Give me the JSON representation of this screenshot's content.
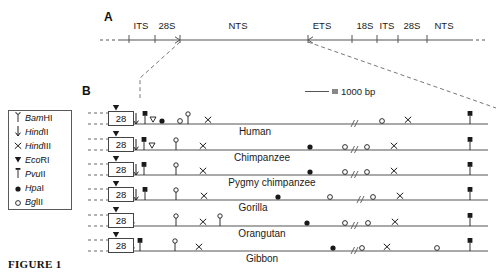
{
  "figure": {
    "caption": "FIGURE 1",
    "panel_a_letter": "A",
    "panel_b_letter": "B"
  },
  "scale": {
    "line_symbol": "line-segment",
    "equals_symbol": "=",
    "label": "1000 bp"
  },
  "panel_a": {
    "segments": [
      {
        "label": "ITS",
        "x": 141
      },
      {
        "label": "28S",
        "x": 167
      },
      {
        "label": "NTS",
        "x": 238
      },
      {
        "label": "ETS",
        "x": 322
      },
      {
        "label": "18S",
        "x": 365
      },
      {
        "label": "ITS",
        "x": 387
      },
      {
        "label": "28S",
        "x": 412
      },
      {
        "label": "NTS",
        "x": 444
      }
    ],
    "axis_y": 40,
    "axis_start_x": 118,
    "axis_end_x": 470,
    "ticks": [
      129,
      155,
      180,
      308,
      352,
      377,
      398,
      427
    ],
    "arrow_ticks": [
      180,
      308
    ]
  },
  "legend": {
    "title": "Restriction enzymes",
    "items": [
      {
        "symbol": "bamhi-lollipop-open",
        "italic": "Bam",
        "rest": "HI"
      },
      {
        "symbol": "hindii-arrow-down",
        "italic": "Hind",
        "rest": "II"
      },
      {
        "symbol": "hindiii-cross",
        "italic": "Hind",
        "rest": "III"
      },
      {
        "symbol": "ecori-triangle-filled",
        "italic": "Eco",
        "rest": "RI"
      },
      {
        "symbol": "pvuii-lollipop-filled-square",
        "italic": "Pvu",
        "rest": "II"
      },
      {
        "symbol": "hpai-dot-filled",
        "italic": "Hpa",
        "rest": "I"
      },
      {
        "symbol": "bgiii-dot-open",
        "italic": "Bg",
        "rest": "lII"
      }
    ]
  },
  "panel_b": {
    "box_label": "28",
    "rows": [
      {
        "species": "Human",
        "y": 124,
        "label_x": 255,
        "line_start": 133,
        "line_end": 488,
        "break_x": 352,
        "markers": [
          {
            "type": "ecori-triangle-filled",
            "x": 116,
            "above": true
          },
          {
            "type": "hindii-arrow-down",
            "x": 136
          },
          {
            "type": "pvuii-lollipop-filled-square",
            "x": 145
          },
          {
            "type": "ecori-triangle-open",
            "x": 153
          },
          {
            "type": "hpai-dot-filled",
            "x": 162
          },
          {
            "type": "bgiii-dot-open",
            "x": 180
          },
          {
            "type": "bamhi-lollipop-open",
            "x": 188
          },
          {
            "type": "hindiii-cross",
            "x": 208
          },
          {
            "type": "bgiii-dot-open",
            "x": 382
          },
          {
            "type": "hindiii-cross",
            "x": 408
          },
          {
            "type": "pvuii-lollipop-filled-square",
            "x": 470
          }
        ]
      },
      {
        "species": "Chimpanzee",
        "y": 150,
        "label_x": 262,
        "line_start": 133,
        "line_end": 488,
        "break_x": 352,
        "markers": [
          {
            "type": "ecori-triangle-filled",
            "x": 116,
            "above": true
          },
          {
            "type": "hindii-arrow-down",
            "x": 136
          },
          {
            "type": "pvuii-lollipop-filled-square",
            "x": 144
          },
          {
            "type": "ecori-triangle-open",
            "x": 152
          },
          {
            "type": "bamhi-lollipop-open",
            "x": 176
          },
          {
            "type": "hindiii-cross",
            "x": 203
          },
          {
            "type": "hpai-dot-filled",
            "x": 310
          },
          {
            "type": "bgiii-dot-open",
            "x": 345
          },
          {
            "type": "bgiii-dot-open",
            "x": 367
          },
          {
            "type": "hindiii-cross",
            "x": 394
          },
          {
            "type": "pvuii-lollipop-filled-square",
            "x": 470
          }
        ]
      },
      {
        "species": "Pygmy chimpanzee",
        "y": 175,
        "label_x": 272,
        "line_start": 133,
        "line_end": 488,
        "break_x": 352,
        "markers": [
          {
            "type": "ecori-triangle-filled",
            "x": 116,
            "above": true
          },
          {
            "type": "hindii-arrow-down",
            "x": 136
          },
          {
            "type": "pvuii-lollipop-filled-square",
            "x": 144
          },
          {
            "type": "bamhi-lollipop-open",
            "x": 176
          },
          {
            "type": "hindiii-cross",
            "x": 203
          },
          {
            "type": "hpai-dot-filled",
            "x": 310
          },
          {
            "type": "bgiii-dot-open",
            "x": 345
          },
          {
            "type": "bgiii-dot-open",
            "x": 367
          },
          {
            "type": "hindiii-cross",
            "x": 394
          },
          {
            "type": "pvuii-lollipop-filled-square",
            "x": 470
          }
        ]
      },
      {
        "species": "Gorilla",
        "y": 200,
        "label_x": 253,
        "line_start": 133,
        "line_end": 488,
        "break_x": 358,
        "markers": [
          {
            "type": "ecori-triangle-filled",
            "x": 116,
            "above": true
          },
          {
            "type": "hindii-arrow-down",
            "x": 136
          },
          {
            "type": "pvuii-lollipop-filled-square",
            "x": 145
          },
          {
            "type": "bamhi-lollipop-open",
            "x": 176
          },
          {
            "type": "hindiii-cross",
            "x": 204
          },
          {
            "type": "hpai-dot-filled",
            "x": 278
          },
          {
            "type": "bgiii-dot-open",
            "x": 330
          },
          {
            "type": "bgiii-dot-open",
            "x": 373
          },
          {
            "type": "hindiii-cross",
            "x": 400
          },
          {
            "type": "pvuii-lollipop-filled-square",
            "x": 470
          }
        ]
      },
      {
        "species": "Orangutan",
        "y": 226,
        "label_x": 262,
        "line_start": 133,
        "line_end": 488,
        "break_x": 352,
        "markers": [
          {
            "type": "ecori-triangle-filled",
            "x": 116,
            "above": true
          },
          {
            "type": "hindii-arrow-down",
            "x": 132
          },
          {
            "type": "bamhi-lollipop-open",
            "x": 176
          },
          {
            "type": "hindiii-cross",
            "x": 203
          },
          {
            "type": "bamhi-lollipop-open",
            "x": 220
          },
          {
            "type": "hpai-dot-filled",
            "x": 307
          },
          {
            "type": "bgiii-dot-open",
            "x": 345
          },
          {
            "type": "bgiii-dot-open",
            "x": 368
          },
          {
            "type": "hindiii-cross",
            "x": 395
          },
          {
            "type": "pvuii-lollipop-filled-square",
            "x": 470
          }
        ]
      },
      {
        "species": "Gibbon",
        "y": 251,
        "label_x": 262,
        "line_start": 133,
        "line_end": 488,
        "break_x": 352,
        "markers": [
          {
            "type": "ecori-triangle-filled",
            "x": 116,
            "above": true
          },
          {
            "type": "hindii-arrow-down",
            "x": 132
          },
          {
            "type": "pvuii-lollipop-filled-square",
            "x": 140
          },
          {
            "type": "bamhi-lollipop-open",
            "x": 175
          },
          {
            "type": "hindiii-cross",
            "x": 199
          },
          {
            "type": "hpai-dot-filled",
            "x": 333
          },
          {
            "type": "bgiii-dot-open",
            "x": 362
          },
          {
            "type": "hindiii-cross",
            "x": 387
          },
          {
            "type": "bgiii-dot-open",
            "x": 437
          },
          {
            "type": "pvuii-lollipop-filled-square",
            "x": 470
          }
        ]
      }
    ]
  },
  "colors": {
    "line": "#555555",
    "ink": "#1a1a1a",
    "dashed": "#777777"
  }
}
